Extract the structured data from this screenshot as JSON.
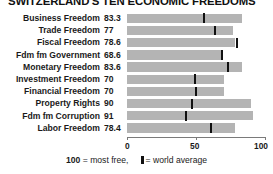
{
  "title": "SWITZERLAND'S TEN ECONOMIC FREEDOMS",
  "legend": {
    "most_free_number": "100",
    "most_free_text": "= most free,",
    "world_average_text": "= world average",
    "marker_icon": "world-average-tick-icon"
  },
  "axis": {
    "ticks": [
      "0",
      "50",
      "100"
    ],
    "min": 0,
    "max": 100
  },
  "colors": {
    "bar": "#b4b4b4",
    "marker": "#111111",
    "axis": "#7a7a7a",
    "text": "#1a1a1a",
    "background": "#ffffff"
  },
  "chart_data": {
    "type": "bar",
    "title": "SWITZERLAND'S TEN ECONOMIC FREEDOMS",
    "xlabel": "",
    "ylabel": "",
    "xlim": [
      0,
      100
    ],
    "orientation": "horizontal",
    "grid": false,
    "legend_position": "bottom",
    "xticks": [
      0,
      50,
      100
    ],
    "categories": [
      "Business Freedom",
      "Trade Freedom",
      "Fiscal Freedom",
      "Fdm fm Government",
      "Monetary Freedom",
      "Investment Freedom",
      "Financial Freedom",
      "Property Rights",
      "Fdm fm Corruption",
      "Labor Freedom"
    ],
    "series": [
      {
        "name": "Switzerland",
        "values": [
          83.3,
          77,
          78.6,
          68.6,
          83.6,
          70,
          70,
          90,
          91,
          78.4
        ]
      },
      {
        "name": "world average",
        "values": [
          56,
          64,
          80,
          69,
          73,
          49,
          50,
          47,
          43,
          61
        ]
      }
    ],
    "value_labels": [
      "83.3",
      "77",
      "78.6",
      "68.6",
      "83.6",
      "70",
      "70",
      "90",
      "91",
      "78.4"
    ]
  }
}
